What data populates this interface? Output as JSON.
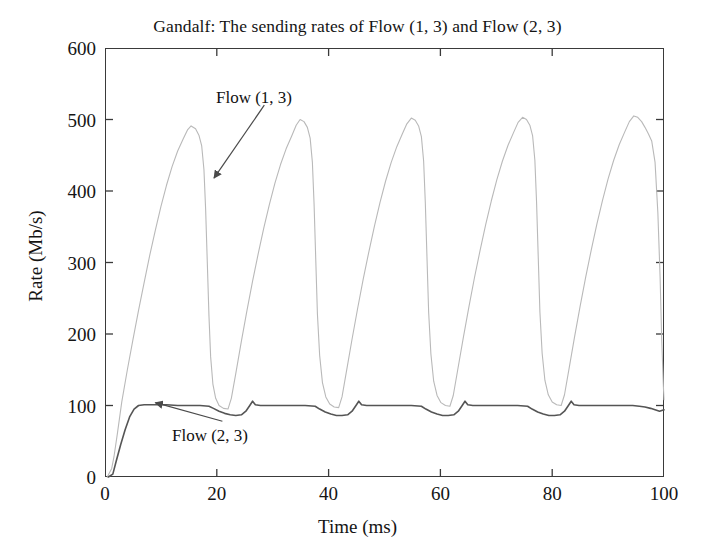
{
  "chart_data": {
    "type": "line",
    "title": "Gandalf: The sending rates of Flow (1, 3) and Flow (2, 3)",
    "xlabel": "Time (ms)",
    "ylabel": "Rate (Mb/s)",
    "xlim": [
      0,
      100
    ],
    "ylim": [
      0,
      600
    ],
    "xticks": [
      0,
      20,
      40,
      60,
      80,
      100
    ],
    "yticks": [
      0,
      100,
      200,
      300,
      400,
      500,
      600
    ],
    "xtick_labels": [
      "0",
      "20",
      "40",
      "60",
      "80",
      "100"
    ],
    "ytick_labels": [
      "0",
      "100",
      "200",
      "300",
      "400",
      "500",
      "600"
    ],
    "grid": false,
    "legend": "none",
    "annotations": [
      {
        "name": "flow-1-3",
        "text": "Flow (1, 3)",
        "text_x": 26.5,
        "text_y": 545,
        "arrow_from_x": 28.5,
        "arrow_from_y": 520,
        "arrow_to_x": 19.5,
        "arrow_to_y": 418
      },
      {
        "name": "flow-2-3",
        "text": "Flow (2, 3)",
        "text_x": 22.0,
        "text_y": 60,
        "arrow_from_x": 21.0,
        "arrow_from_y": 78,
        "arrow_to_x": 9.0,
        "arrow_to_y": 104
      }
    ],
    "series": [
      {
        "name": "Flow (1, 3)",
        "color": "#b9b9b9",
        "line_width": 1.1,
        "points": [
          [
            0.4,
            0
          ],
          [
            1.2,
            12
          ],
          [
            1.6,
            28
          ],
          [
            2.2,
            60
          ],
          [
            3.0,
            105
          ],
          [
            4.0,
            150
          ],
          [
            5.0,
            192
          ],
          [
            6.0,
            233
          ],
          [
            7.0,
            272
          ],
          [
            8.0,
            310
          ],
          [
            9.0,
            345
          ],
          [
            10.0,
            378
          ],
          [
            11.0,
            408
          ],
          [
            12.0,
            434
          ],
          [
            13.0,
            456
          ],
          [
            14.0,
            473
          ],
          [
            14.8,
            486
          ],
          [
            15.4,
            491
          ],
          [
            16.2,
            487
          ],
          [
            16.8,
            478
          ],
          [
            17.3,
            463
          ],
          [
            17.7,
            430
          ],
          [
            18.0,
            375
          ],
          [
            18.3,
            300
          ],
          [
            18.6,
            225
          ],
          [
            18.9,
            168
          ],
          [
            19.3,
            130
          ],
          [
            19.8,
            110
          ],
          [
            20.4,
            100
          ],
          [
            21.2,
            96
          ],
          [
            22.0,
            95
          ],
          [
            22.6,
            110
          ],
          [
            23.4,
            145
          ],
          [
            24.4,
            190
          ],
          [
            25.4,
            233
          ],
          [
            26.4,
            274
          ],
          [
            27.4,
            312
          ],
          [
            28.4,
            348
          ],
          [
            29.4,
            381
          ],
          [
            30.4,
            411
          ],
          [
            31.4,
            437
          ],
          [
            32.4,
            459
          ],
          [
            33.4,
            477
          ],
          [
            34.2,
            492
          ],
          [
            34.9,
            500
          ],
          [
            35.6,
            497
          ],
          [
            36.2,
            489
          ],
          [
            36.7,
            474
          ],
          [
            37.1,
            440
          ],
          [
            37.4,
            382
          ],
          [
            37.7,
            305
          ],
          [
            38.0,
            228
          ],
          [
            38.4,
            170
          ],
          [
            38.9,
            132
          ],
          [
            39.5,
            112
          ],
          [
            40.2,
            102
          ],
          [
            41.0,
            98
          ],
          [
            41.8,
            97
          ],
          [
            42.4,
            112
          ],
          [
            43.2,
            148
          ],
          [
            44.2,
            193
          ],
          [
            45.2,
            236
          ],
          [
            46.2,
            277
          ],
          [
            47.2,
            315
          ],
          [
            48.2,
            351
          ],
          [
            49.2,
            384
          ],
          [
            50.2,
            414
          ],
          [
            51.2,
            440
          ],
          [
            52.2,
            462
          ],
          [
            53.2,
            480
          ],
          [
            54.0,
            494
          ],
          [
            54.8,
            502
          ],
          [
            55.5,
            499
          ],
          [
            56.1,
            491
          ],
          [
            56.6,
            476
          ],
          [
            57.0,
            442
          ],
          [
            57.3,
            384
          ],
          [
            57.6,
            307
          ],
          [
            57.9,
            230
          ],
          [
            58.3,
            172
          ],
          [
            58.8,
            134
          ],
          [
            59.4,
            114
          ],
          [
            60.1,
            104
          ],
          [
            60.9,
            100
          ],
          [
            61.7,
            99
          ],
          [
            62.3,
            114
          ],
          [
            63.1,
            150
          ],
          [
            64.1,
            195
          ],
          [
            65.1,
            238
          ],
          [
            66.1,
            279
          ],
          [
            67.1,
            317
          ],
          [
            68.1,
            353
          ],
          [
            69.1,
            386
          ],
          [
            70.1,
            416
          ],
          [
            71.1,
            442
          ],
          [
            72.1,
            464
          ],
          [
            73.1,
            482
          ],
          [
            73.9,
            496
          ],
          [
            74.7,
            503
          ],
          [
            75.4,
            500
          ],
          [
            76.0,
            492
          ],
          [
            76.5,
            477
          ],
          [
            76.9,
            443
          ],
          [
            77.2,
            385
          ],
          [
            77.5,
            308
          ],
          [
            77.8,
            231
          ],
          [
            78.2,
            173
          ],
          [
            78.7,
            135
          ],
          [
            79.3,
            115
          ],
          [
            80.0,
            105
          ],
          [
            80.8,
            101
          ],
          [
            81.6,
            100
          ],
          [
            82.2,
            115
          ],
          [
            83.0,
            151
          ],
          [
            84.0,
            196
          ],
          [
            85.0,
            239
          ],
          [
            86.0,
            280
          ],
          [
            87.0,
            318
          ],
          [
            88.0,
            354
          ],
          [
            89.0,
            387
          ],
          [
            90.0,
            417
          ],
          [
            91.0,
            443
          ],
          [
            92.0,
            465
          ],
          [
            93.0,
            483
          ],
          [
            93.8,
            497
          ],
          [
            94.6,
            505
          ],
          [
            95.3,
            503
          ],
          [
            96.0,
            497
          ],
          [
            96.6,
            489
          ],
          [
            97.2,
            480
          ],
          [
            97.8,
            470
          ],
          [
            98.4,
            440
          ],
          [
            98.9,
            370
          ],
          [
            99.3,
            280
          ],
          [
            99.6,
            190
          ],
          [
            99.9,
            125
          ],
          [
            100.0,
            108
          ]
        ]
      },
      {
        "name": "Flow (2, 3)",
        "color": "#555555",
        "line_width": 1.6,
        "points": [
          [
            0.6,
            0
          ],
          [
            1.4,
            4
          ],
          [
            2.0,
            22
          ],
          [
            2.8,
            45
          ],
          [
            3.6,
            66
          ],
          [
            4.4,
            84
          ],
          [
            5.2,
            95
          ],
          [
            6.0,
            100
          ],
          [
            7.0,
            101
          ],
          [
            9.0,
            101
          ],
          [
            11.0,
            101
          ],
          [
            13.0,
            100
          ],
          [
            15.0,
            100
          ],
          [
            17.0,
            100
          ],
          [
            18.6,
            99
          ],
          [
            19.4,
            96
          ],
          [
            20.4,
            92
          ],
          [
            21.4,
            89
          ],
          [
            22.4,
            87
          ],
          [
            23.4,
            86
          ],
          [
            24.4,
            87
          ],
          [
            25.2,
            92
          ],
          [
            25.9,
            100
          ],
          [
            26.4,
            106
          ],
          [
            26.9,
            101
          ],
          [
            27.8,
            100
          ],
          [
            29.8,
            100
          ],
          [
            31.8,
            100
          ],
          [
            33.8,
            100
          ],
          [
            35.8,
            100
          ],
          [
            37.6,
            99
          ],
          [
            38.4,
            95
          ],
          [
            39.4,
            91
          ],
          [
            40.4,
            88
          ],
          [
            41.4,
            86
          ],
          [
            42.4,
            86
          ],
          [
            43.4,
            87
          ],
          [
            44.2,
            92
          ],
          [
            44.9,
            100
          ],
          [
            45.4,
            106
          ],
          [
            45.9,
            101
          ],
          [
            46.8,
            100
          ],
          [
            48.8,
            100
          ],
          [
            50.8,
            100
          ],
          [
            52.8,
            100
          ],
          [
            54.8,
            100
          ],
          [
            56.6,
            99
          ],
          [
            57.4,
            95
          ],
          [
            58.4,
            91
          ],
          [
            59.4,
            88
          ],
          [
            60.4,
            86
          ],
          [
            61.4,
            86
          ],
          [
            62.4,
            87
          ],
          [
            63.2,
            92
          ],
          [
            63.9,
            100
          ],
          [
            64.4,
            106
          ],
          [
            64.9,
            101
          ],
          [
            65.8,
            100
          ],
          [
            67.8,
            100
          ],
          [
            69.8,
            100
          ],
          [
            71.8,
            100
          ],
          [
            73.8,
            100
          ],
          [
            75.6,
            99
          ],
          [
            76.4,
            95
          ],
          [
            77.4,
            91
          ],
          [
            78.4,
            88
          ],
          [
            79.4,
            86
          ],
          [
            80.4,
            86
          ],
          [
            81.4,
            87
          ],
          [
            82.2,
            92
          ],
          [
            82.9,
            100
          ],
          [
            83.4,
            106
          ],
          [
            83.9,
            101
          ],
          [
            84.8,
            100
          ],
          [
            86.8,
            100
          ],
          [
            88.8,
            100
          ],
          [
            90.8,
            100
          ],
          [
            92.8,
            100
          ],
          [
            94.4,
            100
          ],
          [
            95.6,
            99
          ],
          [
            96.6,
            98
          ],
          [
            97.6,
            96
          ],
          [
            98.4,
            94
          ],
          [
            99.2,
            92
          ],
          [
            100.0,
            94
          ]
        ]
      }
    ]
  }
}
